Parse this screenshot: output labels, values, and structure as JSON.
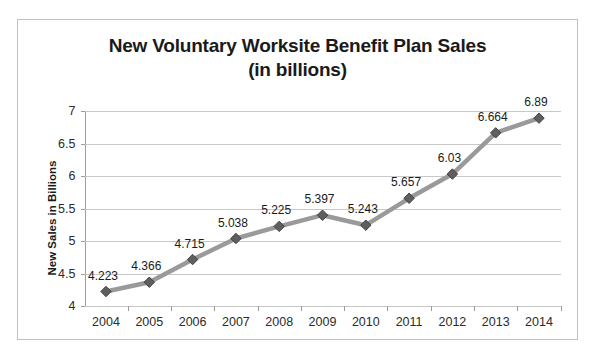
{
  "chart_data": {
    "type": "line",
    "title": "New Voluntary Worksite Benefit Plan Sales",
    "subtitle": "(in billions)",
    "xlabel": "",
    "ylabel": "New Sales in Billions",
    "categories": [
      "2004",
      "2005",
      "2006",
      "2007",
      "2008",
      "2009",
      "2010",
      "2011",
      "2012",
      "2013",
      "2014"
    ],
    "values": [
      4.223,
      4.366,
      4.715,
      5.038,
      5.225,
      5.397,
      5.243,
      5.657,
      6.03,
      6.664,
      6.89
    ],
    "point_labels": [
      "4.223",
      "4.366",
      "4.715",
      "5.038",
      "5.225",
      "5.397",
      "5.243",
      "5.657",
      "6.03",
      "6.664",
      "6.89"
    ],
    "ylim": [
      4,
      7
    ],
    "ytick_labels": [
      "4",
      "4.5",
      "5",
      "5.5",
      "6",
      "6.5",
      "7"
    ],
    "ytick_values": [
      4,
      4.5,
      5,
      5.5,
      6,
      6.5,
      7
    ],
    "grid": true,
    "legend": false,
    "legend_position": "none",
    "marker": "diamond",
    "colors": {
      "line": "#9a9a9a",
      "marker": "#5f5f5f",
      "marker_edge": "#3f3f3f",
      "gridline": "#c8c8c8",
      "axis": "#9d9d9d",
      "frame_border": "#bfbfbf",
      "text": "#1a1a1a",
      "background": "#ffffff"
    }
  }
}
